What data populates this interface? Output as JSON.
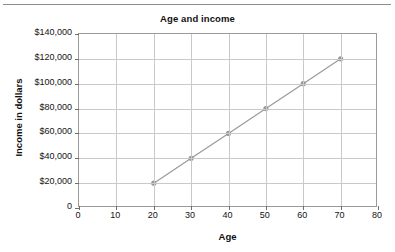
{
  "chart_data": {
    "type": "line",
    "title": "Age and income",
    "xlabel": "Age",
    "ylabel": "Income in dollars",
    "x": [
      20,
      30,
      40,
      50,
      60,
      70
    ],
    "values": [
      20000,
      40000,
      60000,
      80000,
      100000,
      120000
    ],
    "series": [
      {
        "name": "Income",
        "x": [
          20,
          30,
          40,
          50,
          60,
          70
        ],
        "values": [
          20000,
          40000,
          60000,
          80000,
          100000,
          120000
        ]
      }
    ],
    "xlim": [
      0,
      80
    ],
    "ylim": [
      0,
      140000
    ],
    "xticks": [
      0,
      10,
      20,
      30,
      40,
      50,
      60,
      70,
      80
    ],
    "xtick_labels": [
      "0",
      "10",
      "20",
      "30",
      "40",
      "50",
      "60",
      "70",
      "80"
    ],
    "yticks": [
      0,
      20000,
      40000,
      60000,
      80000,
      100000,
      120000,
      140000
    ],
    "ytick_labels": [
      "0",
      "$20,000",
      "$40,000",
      "$60,000",
      "$80,000",
      "$100,000",
      "$120,000",
      "$140,000"
    ],
    "grid": true,
    "legend": false,
    "marker": "circle",
    "line_color": "#9a9a9a",
    "marker_color": "#9a9a9a",
    "grid_color": "#c9c9c9",
    "border_color": "#9a9a9a",
    "text_color": "#141414",
    "background": "#ffffff",
    "annotations": []
  },
  "figure": {
    "top_rule": true
  }
}
